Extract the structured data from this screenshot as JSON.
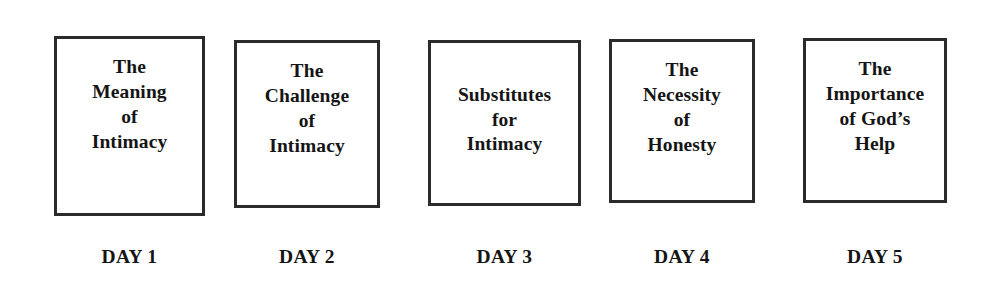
{
  "page": {
    "background_color": "#ffffff",
    "text_color": "#151515",
    "border_color": "#2b2b2b",
    "width": 983,
    "height": 289
  },
  "cards": [
    {
      "title": "The\nMeaning\nof\nIntimacy",
      "caption": "DAY 1",
      "box": {
        "x": 54,
        "y": 36,
        "w": 151,
        "h": 180
      },
      "caption_y": 247,
      "align": "top"
    },
    {
      "title": "The\nChallenge\nof\nIntimacy",
      "caption": "DAY 2",
      "box": {
        "x": 234,
        "y": 40,
        "w": 146,
        "h": 168
      },
      "caption_y": 247,
      "align": "top"
    },
    {
      "title": "Substitutes\nfor\nIntimacy",
      "caption": "DAY 3",
      "box": {
        "x": 428,
        "y": 40,
        "w": 153,
        "h": 166
      },
      "caption_y": 247,
      "align": "center"
    },
    {
      "title": "The\nNecessity\nof\nHonesty",
      "caption": "DAY 4",
      "box": {
        "x": 609,
        "y": 39,
        "w": 146,
        "h": 164
      },
      "caption_y": 247,
      "align": "top"
    },
    {
      "title": "The\nImportance\nof God’s\nHelp",
      "caption": "DAY 5",
      "box": {
        "x": 803,
        "y": 38,
        "w": 144,
        "h": 165
      },
      "caption_y": 247,
      "align": "top"
    }
  ]
}
